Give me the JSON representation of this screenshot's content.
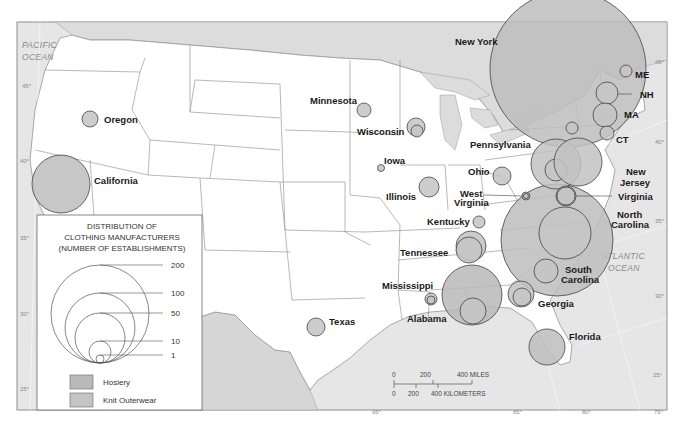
{
  "map": {
    "title": "Distribution of Clothing Manufacturers",
    "colors": {
      "ocean": "#e6e6e6",
      "foreign_land": "#dcdcdc",
      "us_land": "#ffffff",
      "border": "#7a7a7a",
      "hosiery": "#b9b9b9",
      "knit_outerwear": "#c4c4c4",
      "circle_stroke": "#444444"
    },
    "ocean_labels": [
      {
        "id": "pacific",
        "lines": [
          "PACIFIC",
          "OCEAN"
        ]
      },
      {
        "id": "atlantic",
        "lines": [
          "ATLANTIC",
          "OCEAN"
        ]
      }
    ],
    "latitude_ticks_left": [
      "45°",
      "40°",
      "35°",
      "30°",
      "25°"
    ],
    "latitude_ticks_right": [
      "45°",
      "40°",
      "35°",
      "30°",
      "25°"
    ],
    "longitude_ticks_bottom": [
      "95°",
      "85°",
      "80°",
      "75°"
    ],
    "states": [
      {
        "name": "Oregon",
        "hosiery": null,
        "knit_outerwear": 8
      },
      {
        "name": "California",
        "hosiery": null,
        "knit_outerwear": 95
      },
      {
        "name": "Minnesota",
        "hosiery": null,
        "knit_outerwear": 7
      },
      {
        "name": "Wisconsin",
        "hosiery": 5,
        "knit_outerwear": 12
      },
      {
        "name": "Iowa",
        "hosiery": null,
        "knit_outerwear": 2
      },
      {
        "name": "Illinois",
        "hosiery": null,
        "knit_outerwear": 15
      },
      {
        "name": "Texas",
        "hosiery": null,
        "knit_outerwear": 9
      },
      {
        "name": "New York",
        "hosiery": null,
        "knit_outerwear": 600
      },
      {
        "name": "ME",
        "hosiery": null,
        "knit_outerwear": 5
      },
      {
        "name": "NH",
        "hosiery": 15,
        "knit_outerwear": null
      },
      {
        "name": "MA",
        "hosiery": null,
        "knit_outerwear": 20
      },
      {
        "name": "CT",
        "hosiery": null,
        "knit_outerwear": 10
      },
      {
        "name": "Pennsylvania",
        "hosiery": 60,
        "knit_outerwear": 120
      },
      {
        "name": "New Jersey",
        "hosiery": null,
        "knit_outerwear": 110
      },
      {
        "name": "Ohio",
        "hosiery": null,
        "knit_outerwear": 10
      },
      {
        "name": "West Virginia",
        "hosiery": 1,
        "knit_outerwear": 2
      },
      {
        "name": "Virginia",
        "hosiery": 15,
        "knit_outerwear": 15
      },
      {
        "name": "North Carolina",
        "hosiery": 240,
        "knit_outerwear": 500
      },
      {
        "name": "Kentucky",
        "hosiery": null,
        "knit_outerwear": 3
      },
      {
        "name": "Tennessee",
        "hosiery": 30,
        "knit_outerwear": 35
      },
      {
        "name": "South Carolina",
        "hosiery": null,
        "knit_outerwear": 20
      },
      {
        "name": "Mississippi",
        "hosiery": 4,
        "knit_outerwear": 6
      },
      {
        "name": "Alabama",
        "hosiery": 40,
        "knit_outerwear": 200
      },
      {
        "name": "Georgia",
        "hosiery": 20,
        "knit_outerwear": 35
      },
      {
        "name": "Florida",
        "hosiery": null,
        "knit_outerwear": 45
      }
    ],
    "state_labels": {
      "oregon": "Oregon",
      "california": "California",
      "minnesota": "Minnesota",
      "wisconsin": "Wisconsin",
      "iowa": "Iowa",
      "illinois": "Illinois",
      "texas": "Texas",
      "new_york": "New York",
      "me": "ME",
      "nh": "NH",
      "ma": "MA",
      "ct": "CT",
      "pennsylvania": "Pennsylvania",
      "new_jersey": [
        "New",
        "Jersey"
      ],
      "ohio": "Ohio",
      "west_virginia": [
        "West",
        "Virginia"
      ],
      "virginia": "Virginia",
      "north_carolina": [
        "North",
        "Carolina"
      ],
      "kentucky": "Kentucky",
      "tennessee": "Tennessee",
      "south_carolina": [
        "South",
        "Carolina"
      ],
      "mississippi": "Mississippi",
      "alabama": "Alabama",
      "georgia": "Georgia",
      "florida": "Florida"
    }
  },
  "legend": {
    "title_lines": [
      "DISTRIBUTION OF",
      "CLOTHING MANUFACTURERS",
      "(NUMBER OF ESTABLISHMENTS)"
    ],
    "size_values": [
      "200",
      "100",
      "50",
      "10",
      "1"
    ],
    "categories": [
      {
        "label": "Hosiery"
      },
      {
        "label": "Knit Outerwear"
      }
    ]
  },
  "scale_bar": {
    "miles_labels": [
      "0",
      "200",
      "400 MILES"
    ],
    "km_labels": [
      "0",
      "200",
      "400 KILOMETERS"
    ]
  }
}
